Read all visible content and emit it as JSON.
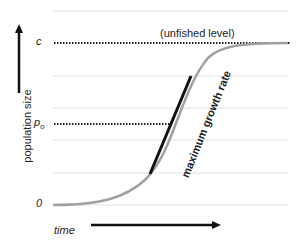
{
  "diagram": {
    "type": "logistic-growth-curve",
    "labels": {
      "y_axis": "population size",
      "x_axis": "time",
      "c_tick": "c",
      "p0_tick": "p",
      "p0_subscript": "o",
      "zero_tick": "0",
      "unfished": "(unfished level)",
      "tangent": "maximum growth rate"
    },
    "colors": {
      "curve": "#a0a0a0",
      "tangent": "#111111",
      "gridline": "#e2e2e2",
      "dotted": "#222222",
      "arrow": "#111111"
    }
  }
}
